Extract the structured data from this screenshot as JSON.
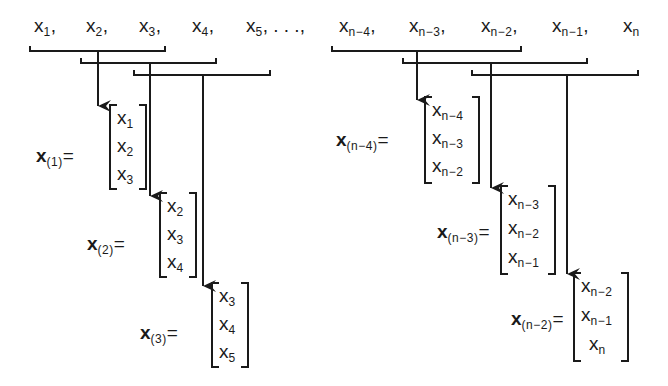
{
  "sequence": {
    "left": [
      {
        "base": "x",
        "sub": "1",
        "sep": ","
      },
      {
        "base": "x",
        "sub": "2",
        "sep": ","
      },
      {
        "base": "x",
        "sub": "3",
        "sep": ","
      },
      {
        "base": "x",
        "sub": "4",
        "sep": ","
      },
      {
        "base": "x",
        "sub": "5",
        "sep": ", . . .,"
      }
    ],
    "right": [
      {
        "base": "x",
        "sub": "n−4",
        "sep": ","
      },
      {
        "base": "x",
        "sub": "n−3",
        "sep": ","
      },
      {
        "base": "x",
        "sub": "n−2",
        "sep": ","
      },
      {
        "base": "x",
        "sub": "n−1",
        "sep": ","
      },
      {
        "base": "x",
        "sub": "n",
        "sep": ""
      }
    ]
  },
  "windows": [
    {
      "label_base": "x",
      "label_sub": "(1)",
      "eq": "=",
      "entries": [
        {
          "b": "x",
          "s": "1"
        },
        {
          "b": "x",
          "s": "2"
        },
        {
          "b": "x",
          "s": "3"
        }
      ]
    },
    {
      "label_base": "x",
      "label_sub": "(2)",
      "eq": "=",
      "entries": [
        {
          "b": "x",
          "s": "2"
        },
        {
          "b": "x",
          "s": "3"
        },
        {
          "b": "x",
          "s": "4"
        }
      ]
    },
    {
      "label_base": "x",
      "label_sub": "(3)",
      "eq": "=",
      "entries": [
        {
          "b": "x",
          "s": "3"
        },
        {
          "b": "x",
          "s": "4"
        },
        {
          "b": "x",
          "s": "5"
        }
      ]
    },
    {
      "label_base": "x",
      "label_sub": "(n−4)",
      "eq": "=",
      "entries": [
        {
          "b": "x",
          "s": "n−4"
        },
        {
          "b": "x",
          "s": "n−3"
        },
        {
          "b": "x",
          "s": "n−2"
        }
      ]
    },
    {
      "label_base": "x",
      "label_sub": "(n−3)",
      "eq": "=",
      "entries": [
        {
          "b": "x",
          "s": "n−3"
        },
        {
          "b": "x",
          "s": "n−2"
        },
        {
          "b": "x",
          "s": "n−1"
        }
      ]
    },
    {
      "label_base": "x",
      "label_sub": "(n−2)",
      "eq": "=",
      "entries": [
        {
          "b": "x",
          "s": "n−2"
        },
        {
          "b": "x",
          "s": "n−1"
        },
        {
          "b": "x",
          "s": "n"
        }
      ]
    }
  ],
  "colors": {
    "ink": "#1a1a1a",
    "background": "#ffffff"
  }
}
